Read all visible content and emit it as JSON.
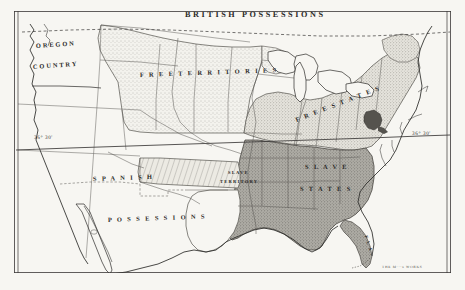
{
  "figure": {
    "kind": "historical-map",
    "background_color": "#f7f6f2",
    "ink_color": "#2b2a28",
    "frame_color": "#3a3836"
  },
  "regions": [
    {
      "id": "british-possessions",
      "label": "BRITISH  POSSESSIONS",
      "x": 185,
      "y": 10,
      "style": "lbl-region",
      "rotate": 0
    },
    {
      "id": "oregon-country-line1",
      "label": "OREGON",
      "x": 36,
      "y": 43,
      "style": "lbl-region-sm",
      "rotate": -4
    },
    {
      "id": "oregon-country-line2",
      "label": "COUNTRY",
      "x": 33,
      "y": 64,
      "style": "lbl-region-sm",
      "rotate": -4
    },
    {
      "id": "free-territories",
      "label": "F R E E   T E R R I T O R I E S",
      "x": 140,
      "y": 72,
      "style": "lbl-region-sm",
      "rotate": -2
    },
    {
      "id": "free-states",
      "label": "F R E E   S T A T E S",
      "x": 296,
      "y": 117,
      "style": "lbl-region-sm",
      "rotate": -21
    },
    {
      "id": "spanish",
      "label": "S P A N I S H",
      "x": 93,
      "y": 176,
      "style": "lbl-region-sm",
      "rotate": -2
    },
    {
      "id": "possessions",
      "label": "P O S S E S S I O N S",
      "x": 108,
      "y": 217,
      "style": "lbl-region-sm",
      "rotate": -2
    },
    {
      "id": "slave-territory-line1",
      "label": "SLAVE",
      "x": 228,
      "y": 170,
      "style": "lbl-tiny",
      "rotate": 0
    },
    {
      "id": "slave-territory-line2",
      "label": "TERRITORY",
      "x": 220,
      "y": 179,
      "style": "lbl-tiny",
      "rotate": 0
    },
    {
      "id": "slave-states-line1",
      "label": "S L A V E",
      "x": 305,
      "y": 164,
      "style": "lbl-region-sm",
      "rotate": 0
    },
    {
      "id": "slave-states-line2",
      "label": "S T A T E S",
      "x": 300,
      "y": 186,
      "style": "lbl-region-sm",
      "rotate": 0
    },
    {
      "id": "florida",
      "label": "F L A .",
      "x": 366,
      "y": 233,
      "style": "lbl-tiny",
      "rotate": 72
    }
  ],
  "coordinates": [
    {
      "id": "compromise-line-west",
      "label": "36° 30'",
      "x": 34,
      "y": 135
    },
    {
      "id": "compromise-line-east",
      "label": "36° 30'",
      "x": 412,
      "y": 131
    }
  ],
  "credit": {
    "id": "engraver-imprint",
    "label": "THE M···s WORKS",
    "x": 382,
    "y": 265
  },
  "map_geometry": {
    "frame": {
      "x": 14,
      "y": 11,
      "w": 437,
      "h": 262
    },
    "fills": {
      "free_territory_stipple": "#ebeae4",
      "free_states_stipple": "#d8d6cf",
      "slave_states_shade": "#a9a7a0",
      "slave_territory_hatch": "#c9c7c0",
      "unshaded": "#f7f6f2",
      "dark_marker": "#55534e"
    }
  }
}
